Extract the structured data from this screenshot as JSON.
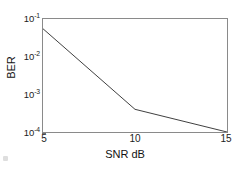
{
  "figure": {
    "background_color": "#ffffff",
    "frame_color": "#8a8a8a",
    "line_color": "#3d3d3d"
  },
  "chart_data": {
    "type": "line",
    "title": "",
    "subtitle": "",
    "xlabel": "SNR dB",
    "ylabel": "BER",
    "xscale": "linear",
    "yscale": "log",
    "xlim": [
      5,
      15
    ],
    "ylim": [
      0.0001,
      0.1
    ],
    "grid": false,
    "legend": null,
    "legend_position": "none",
    "x_tick_labels": [
      "5",
      "10",
      "15"
    ],
    "x_ticks": [
      5,
      10,
      15
    ],
    "y_ticks": [
      0.1,
      0.01,
      0.001,
      0.0001
    ],
    "y_tick_labels": [
      {
        "mantissa": "10",
        "exponent": "-1"
      },
      {
        "mantissa": "10",
        "exponent": "-2"
      },
      {
        "mantissa": "10",
        "exponent": "-3"
      },
      {
        "mantissa": "10",
        "exponent": "-4"
      }
    ],
    "series": [
      {
        "name": "BER",
        "x": [
          5,
          10,
          15
        ],
        "values": [
          0.055,
          0.0004,
          0.0001
        ],
        "marker": "none",
        "linewidth": 1
      }
    ]
  }
}
